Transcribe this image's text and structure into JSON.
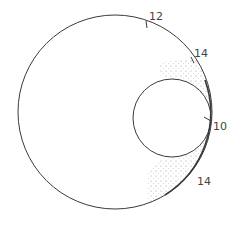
{
  "diagram": {
    "outer_circle": {
      "label": "outer-circle"
    },
    "inner_circle": {
      "label": "inner-circle"
    },
    "labels": [
      {
        "id": "top",
        "text": "12"
      },
      {
        "id": "upper-right",
        "text": "14"
      },
      {
        "id": "tangent",
        "text": "10"
      },
      {
        "id": "lower-right",
        "text": "14"
      }
    ],
    "colors": {
      "stroke": "#3a3a3a",
      "stipple": "#9a9a9a"
    }
  }
}
